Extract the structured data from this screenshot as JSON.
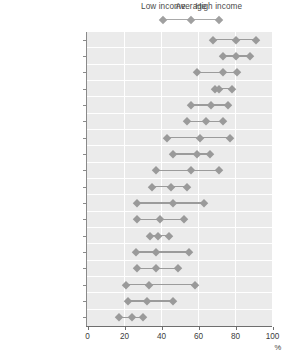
{
  "chart_data": {
    "type": "scatter",
    "title": "",
    "subtitle": "",
    "xlabel": "%",
    "ylabel": "",
    "xlim": [
      0,
      100
    ],
    "xticks": [
      0,
      20,
      40,
      60,
      80,
      100
    ],
    "xticklabels": [
      "0",
      "20",
      "40",
      "60",
      "80",
      "100"
    ],
    "grid": "vertical",
    "legend_position": "top",
    "legend": [
      {
        "name": "Low income",
        "marker": "diamond",
        "x_pos": 41
      },
      {
        "name": "Average",
        "marker": "diamond",
        "x_pos": 56
      },
      {
        "name": "High income",
        "marker": "diamond",
        "x_pos": 71
      }
    ],
    "series": [
      {
        "name": "Low income",
        "values": [
          68,
          73,
          59,
          69,
          56,
          54,
          43,
          46,
          37,
          35,
          27,
          27,
          34,
          26,
          27,
          21,
          22,
          17
        ]
      },
      {
        "name": "Average",
        "values": [
          80,
          80,
          73,
          71,
          67,
          64,
          61,
          59,
          56,
          45,
          46,
          39,
          38,
          37,
          37,
          33,
          32,
          24
        ]
      },
      {
        "name": "High income",
        "values": [
          91,
          88,
          81,
          78,
          76,
          73,
          77,
          66,
          71,
          54,
          63,
          52,
          44,
          55,
          49,
          58,
          46,
          30
        ]
      }
    ],
    "categories": [
      "Denmark",
      "Netherlands",
      "Switzerland",
      "Sweden",
      "Austria",
      "United Kingdom",
      "Canada",
      "Belgium",
      "Finland",
      "Australia",
      "United States",
      "Italy",
      "France",
      "Ireland",
      "Hungary",
      "Portugal",
      "Spain",
      "Greece"
    ]
  },
  "colors": {
    "marker": "#9a9a9a",
    "connector": "#9b9b9b",
    "plot_background": "#ebebeb",
    "gridline": "#ffffff",
    "axis": "#6e6e6e",
    "text": "#3c3c3c",
    "legend_text": "#4a4a4a"
  }
}
